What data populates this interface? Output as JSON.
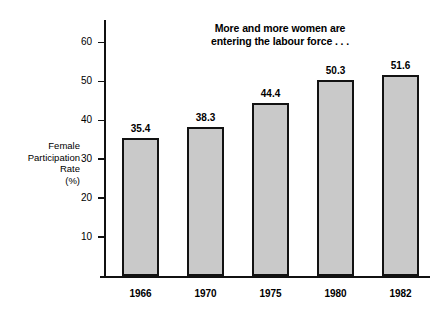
{
  "chart_data": {
    "type": "bar",
    "title": "More and more women are entering the labour force . . .",
    "title_lines": [
      "More and more women are",
      "entering the labour force . . ."
    ],
    "xlabel": "",
    "ylabel": "Female Participation Rate (%)",
    "ylabel_lines": [
      "Female",
      "Participation",
      "Rate",
      "(%)"
    ],
    "categories": [
      "1966",
      "1970",
      "1975",
      "1980",
      "1982"
    ],
    "values": [
      35.4,
      38.3,
      44.4,
      50.3,
      51.6
    ],
    "value_labels": [
      "35.4",
      "38.3",
      "44.4",
      "50.3",
      "51.6"
    ],
    "ylim": [
      0,
      65
    ],
    "yticks": [
      10,
      20,
      30,
      40,
      50,
      60
    ],
    "ytick_labels": [
      "10",
      "20",
      "30",
      "40",
      "50",
      "60"
    ],
    "grid": false,
    "legend": null,
    "bar_fill_color": "#c9c9c9",
    "bar_edge_color": "#121212",
    "background_color": "#ffffff",
    "axis_color": "#111111"
  }
}
